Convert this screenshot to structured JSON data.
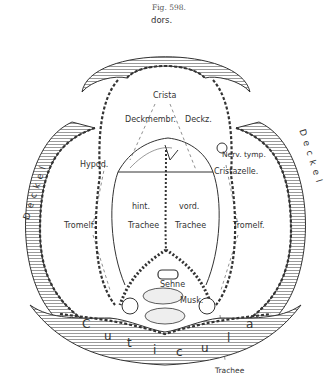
{
  "figure": {
    "caption": "Fig. 598.",
    "orientation_label": "dors."
  },
  "labels": {
    "crista": "Crista",
    "deckmembr": "Deckmembr.",
    "deckz": "Deckz.",
    "nerv_tymp": "Nerv. tymp.",
    "cristazelle": "Cristazelle.",
    "hypod": "Hypod.",
    "deckel_left": "Deckel",
    "deckel_right": "Deckel",
    "tromelf_left": "Tromelf.",
    "tromelf_right": "Tromelf.",
    "hint": "hint.",
    "vord": "vord.",
    "trachee_left": "Trachee",
    "trachee_right": "Trachee",
    "sehne": "Sehne",
    "musk": "Musk.",
    "cuticula_letters": [
      "C",
      "u",
      "t",
      "i",
      "c",
      "u",
      "l",
      "a"
    ],
    "trachee_bottom": "Trachee"
  },
  "colors": {
    "ink": "#333333",
    "paper": "#ffffff"
  }
}
